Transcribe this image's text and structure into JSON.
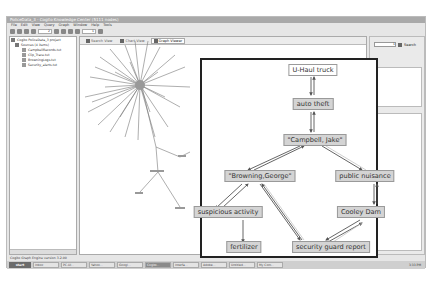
{
  "window": {
    "title": "PoliceData_3 - Cogito Knowledge Center (5111 nodes)",
    "menu": [
      "File",
      "Edit",
      "View",
      "Query",
      "Graph",
      "Window",
      "Help",
      "Tools"
    ],
    "toolbar": {
      "zoom_value": "2",
      "field_value": "1"
    }
  },
  "left_panel": {
    "tree": [
      {
        "label": "Cogito PoliceData_3 project",
        "level": 0
      },
      {
        "label": "Sources (4 items)",
        "level": 1
      },
      {
        "label": "CampbellRecords.txt",
        "level": 2
      },
      {
        "label": "Clip_Trace.txt",
        "level": 2
      },
      {
        "label": "BrowningLogs.txt",
        "level": 2
      },
      {
        "label": "Security_alerts.txt",
        "level": 2
      }
    ]
  },
  "main_panel": {
    "tabs": [
      {
        "label": "Search View",
        "active": false
      },
      {
        "label": "Chart View",
        "active": false
      },
      {
        "label": "Graph Viewer",
        "active": true
      }
    ]
  },
  "right_panel": {
    "search_field_value": "1",
    "search_button": "Search"
  },
  "status_bar": {
    "text": "Cogito Graph Engine version 3.2.00"
  },
  "taskbar": {
    "start": "start",
    "tasks": [
      "Inbox",
      "PC-UI...",
      "Yahoo...",
      "Googl...",
      "Cogito...",
      "Interfa...",
      "Adobe...",
      "Untitled...",
      "My Com..."
    ],
    "active_index": 4,
    "clock": "3:33 PM"
  },
  "graph_detail": {
    "nodes": [
      {
        "id": "uhaul",
        "label": "U-Haul truck",
        "style": "white"
      },
      {
        "id": "auto",
        "label": "auto theft",
        "style": "gray"
      },
      {
        "id": "campbell",
        "label": "\"Campbell, Jake\"",
        "style": "gray"
      },
      {
        "id": "browning",
        "label": "\"Browning,George\"",
        "style": "gray"
      },
      {
        "id": "nuisance",
        "label": "public nuisance",
        "style": "gray"
      },
      {
        "id": "suspicious",
        "label": "suspicious activity",
        "style": "gray"
      },
      {
        "id": "cooley",
        "label": "Cooley Dam",
        "style": "gray"
      },
      {
        "id": "fertilizer",
        "label": "fertilizer",
        "style": "gray"
      },
      {
        "id": "security",
        "label": "security guard report",
        "style": "gray"
      }
    ]
  }
}
